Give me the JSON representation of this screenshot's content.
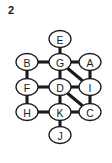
{
  "figure": {
    "label": "2",
    "background_color": "#ffffff",
    "stroke_color": "#1a1a1a",
    "node_fill_color": "#ffffff"
  },
  "graph": {
    "type": "undirected-node-link-diagram",
    "node_shape": "ellipse",
    "node_rx": 11,
    "node_ry": 8.5,
    "nodes": [
      {
        "id": "E",
        "label": "E",
        "cx": 60,
        "cy": 39
      },
      {
        "id": "B",
        "label": "B",
        "cx": 27,
        "cy": 62
      },
      {
        "id": "G",
        "label": "G",
        "cx": 60,
        "cy": 62
      },
      {
        "id": "A",
        "label": "A",
        "cx": 90,
        "cy": 62
      },
      {
        "id": "F",
        "label": "F",
        "cx": 27,
        "cy": 87
      },
      {
        "id": "D",
        "label": "D",
        "cx": 60,
        "cy": 87
      },
      {
        "id": "I",
        "label": "I",
        "cx": 90,
        "cy": 87
      },
      {
        "id": "H",
        "label": "H",
        "cx": 27,
        "cy": 112
      },
      {
        "id": "K",
        "label": "K",
        "cx": 60,
        "cy": 112
      },
      {
        "id": "C",
        "label": "C",
        "cx": 90,
        "cy": 112
      },
      {
        "id": "J",
        "label": "J",
        "cx": 60,
        "cy": 135
      }
    ],
    "edges": [
      {
        "from": "E",
        "to": "G"
      },
      {
        "from": "B",
        "to": "G"
      },
      {
        "from": "G",
        "to": "A"
      },
      {
        "from": "B",
        "to": "F"
      },
      {
        "from": "G",
        "to": "D"
      },
      {
        "from": "A",
        "to": "I"
      },
      {
        "from": "G",
        "to": "I"
      },
      {
        "from": "F",
        "to": "D"
      },
      {
        "from": "D",
        "to": "I"
      },
      {
        "from": "F",
        "to": "H"
      },
      {
        "from": "D",
        "to": "K"
      },
      {
        "from": "I",
        "to": "C"
      },
      {
        "from": "D",
        "to": "C"
      },
      {
        "from": "H",
        "to": "K"
      },
      {
        "from": "K",
        "to": "C"
      },
      {
        "from": "K",
        "to": "J"
      }
    ]
  }
}
